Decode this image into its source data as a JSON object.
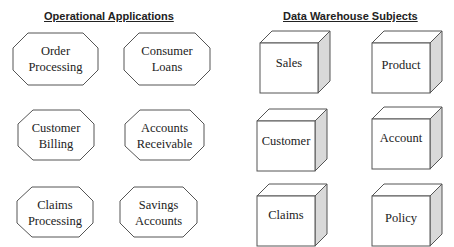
{
  "headers": {
    "left": "Operational Applications",
    "right": "Data Warehouse Subjects"
  },
  "operational_applications": [
    {
      "lines": [
        "Order",
        "Processing"
      ]
    },
    {
      "lines": [
        "Consumer",
        "Loans"
      ]
    },
    {
      "lines": [
        "Customer",
        "Billing"
      ]
    },
    {
      "lines": [
        "Accounts",
        "Receivable"
      ]
    },
    {
      "lines": [
        "Claims",
        "Processing"
      ]
    },
    {
      "lines": [
        "Savings",
        "Accounts"
      ]
    }
  ],
  "data_warehouse_subjects": [
    {
      "label": "Sales"
    },
    {
      "label": "Product"
    },
    {
      "label": "Customer"
    },
    {
      "label": "Account"
    },
    {
      "label": "Claims"
    },
    {
      "label": "Policy"
    }
  ],
  "colors": {
    "stroke": "#555555",
    "side_fill": "#d9d9d9",
    "text": "#222222"
  }
}
